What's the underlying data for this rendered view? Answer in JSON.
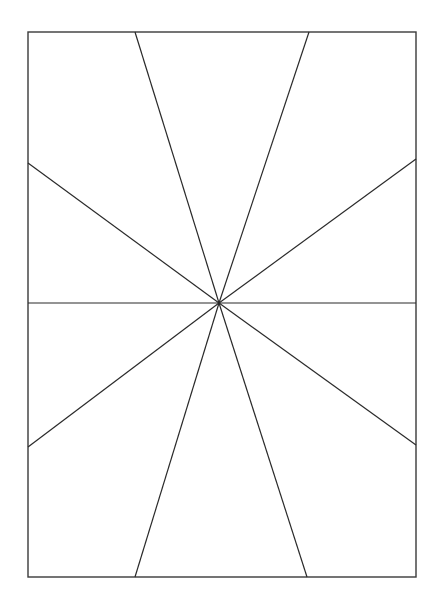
{
  "figure": {
    "title": "",
    "background_color": "#ffffff",
    "width": 440,
    "height": 614,
    "stroke_color": "#2a2a2a",
    "stroke_width": 1.2,
    "frame": {
      "name": "bounding-rectangle",
      "x": 28,
      "y": 32,
      "width": 388,
      "height": 545,
      "stroke_color": "#3a3a3a",
      "stroke_width": 1.4
    },
    "center_point": {
      "label": "convergence-point",
      "x": 219,
      "y": 303
    },
    "rays": [
      {
        "id": "ray-top-left",
        "label": "to top edge left",
        "x1": 219,
        "y1": 303,
        "x2": 135,
        "y2": 32
      },
      {
        "id": "ray-top-right",
        "label": "to top edge right",
        "x1": 219,
        "y1": 303,
        "x2": 309,
        "y2": 32
      },
      {
        "id": "ray-left-upper",
        "label": "to left edge upper",
        "x1": 219,
        "y1": 303,
        "x2": 28,
        "y2": 163
      },
      {
        "id": "ray-right-upper",
        "label": "to right edge upper",
        "x1": 219,
        "y1": 303,
        "x2": 416,
        "y2": 159
      },
      {
        "id": "ray-left-horizontal",
        "label": "to left edge horizontal",
        "x1": 219,
        "y1": 303,
        "x2": 28,
        "y2": 303
      },
      {
        "id": "ray-right-horizontal",
        "label": "to right edge horizontal",
        "x1": 219,
        "y1": 303,
        "x2": 416,
        "y2": 303
      },
      {
        "id": "ray-left-lower",
        "label": "to left edge lower",
        "x1": 219,
        "y1": 303,
        "x2": 28,
        "y2": 447
      },
      {
        "id": "ray-right-lower",
        "label": "to right edge lower",
        "x1": 219,
        "y1": 303,
        "x2": 416,
        "y2": 445
      },
      {
        "id": "ray-bottom-left",
        "label": "to bottom edge left",
        "x1": 219,
        "y1": 303,
        "x2": 135,
        "y2": 577
      },
      {
        "id": "ray-bottom-right",
        "label": "to bottom edge right",
        "x1": 219,
        "y1": 303,
        "x2": 307,
        "y2": 577
      }
    ]
  }
}
